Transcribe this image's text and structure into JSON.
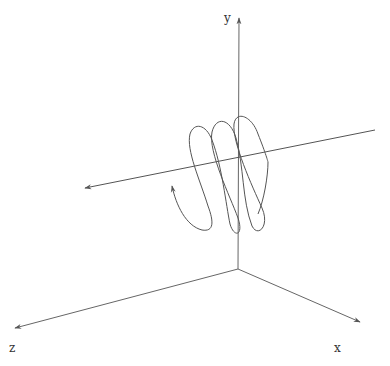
{
  "figure": {
    "type": "3d-helix-diagram",
    "background": "#ffffff",
    "line_color": "#555555"
  },
  "axes": {
    "origin": [
      238,
      269
    ],
    "x": {
      "label": "x",
      "end": [
        360,
        322
      ],
      "label_pos": [
        336,
        350
      ]
    },
    "y": {
      "label": "y",
      "end": [
        239,
        18
      ],
      "label_pos": [
        227,
        21
      ]
    },
    "z": {
      "label": "z",
      "end": [
        15,
        328
      ],
      "label_pos": [
        10,
        351
      ]
    }
  },
  "helix_axis": {
    "name": "helix-axis-line",
    "start_arrow": [
      85,
      188
    ],
    "end": [
      375,
      130
    ]
  },
  "helix": {
    "turns": 3.4,
    "start_arrow": [
      172,
      185
    ],
    "end": [
      268,
      162
    ]
  }
}
